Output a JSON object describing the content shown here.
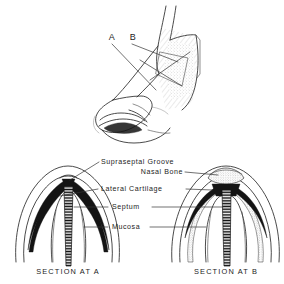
{
  "figure": {
    "background_color": "#ffffff",
    "ink_color": "#2b2b2b",
    "shade_color": "#b9b9b9"
  },
  "profile": {
    "name": "lateral-nose-profile",
    "section_marks": [
      {
        "id": "A",
        "label": "A"
      },
      {
        "id": "B",
        "label": "B"
      }
    ]
  },
  "annotations": [
    {
      "id": "supraseptal-groove",
      "label": "Supraseptal Groove"
    },
    {
      "id": "nasal-bone",
      "label": "Nasal  Bone"
    },
    {
      "id": "lateral-cartilage",
      "label": "Lateral  Cartilage"
    },
    {
      "id": "septum",
      "label": "Septum"
    },
    {
      "id": "mucosa",
      "label": "Mucosa"
    }
  ],
  "sections": [
    {
      "id": "section-a",
      "caption": "SECTION  AT  A"
    },
    {
      "id": "section-b",
      "caption": "SECTION  AT  B"
    }
  ]
}
